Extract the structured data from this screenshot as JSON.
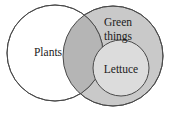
{
  "diagram": {
    "type": "venn-diagram",
    "title": "",
    "sets": [
      {
        "id": "plants",
        "label": "Plants",
        "fill": "#ffffff",
        "stroke": "#4a4a4a",
        "cx": 55,
        "cy": 53,
        "r": 48,
        "label_x": 48,
        "label_y": 53
      },
      {
        "id": "green-things",
        "label_line1": "Green",
        "label_line2": "things",
        "fill": "#c9c9c9",
        "stroke": "#4a4a4a",
        "cx": 113,
        "cy": 56,
        "r": 50,
        "label_x": 118,
        "label_y": 23
      },
      {
        "id": "lettuce",
        "label": "Lettuce",
        "fill": "#dcdcdc",
        "stroke": "#4a4a4a",
        "cx": 121,
        "cy": 68,
        "r": 28,
        "label_x": 121,
        "label_y": 70
      }
    ],
    "intersection": {
      "id": "plants-green-things-overlap",
      "fill": "#b5b5b5",
      "label": ""
    },
    "colors": {
      "background": "#ffffff",
      "outline": "#4a4a4a",
      "text": "#1b1b1b",
      "overlap_fill": "#b5b5b5",
      "green_things_fill": "#c9c9c9",
      "lettuce_fill": "#dcdcdc",
      "plants_fill": "#ffffff"
    }
  }
}
